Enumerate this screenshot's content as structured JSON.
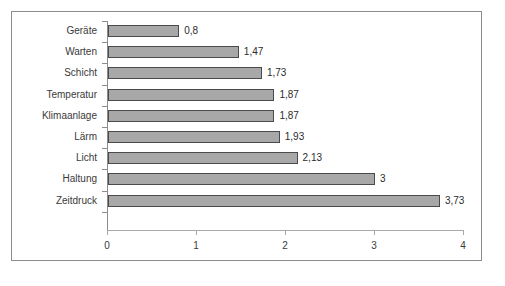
{
  "chart_data": {
    "type": "bar",
    "orientation": "horizontal",
    "title": "",
    "xlabel": "",
    "ylabel": "",
    "xlim": [
      0,
      4
    ],
    "xticks": [
      "0",
      "1",
      "2",
      "3",
      "4"
    ],
    "xtick_values": [
      0,
      1,
      2,
      3,
      4
    ],
    "grid": false,
    "legend": null,
    "categories": [
      "Geräte",
      "Warten",
      "Schicht",
      "Temperatur",
      "Klimaanlage",
      "Lärm",
      "Licht",
      "Haltung",
      "Zeitdruck"
    ],
    "values": [
      0.8,
      1.47,
      1.73,
      1.87,
      1.87,
      1.93,
      2.13,
      3,
      3.73
    ],
    "value_labels": [
      "0,8",
      "1,47",
      "1,73",
      "1,87",
      "1,87",
      "1,93",
      "2,13",
      "3",
      "3,73"
    ],
    "bar_color": "#a8a8a8",
    "bar_border_color": "#4a4a4a",
    "axis_color": "#8c8c8c",
    "text_color": "#3a3a3a",
    "background": "#ffffff"
  },
  "caption": {
    "text": ""
  }
}
